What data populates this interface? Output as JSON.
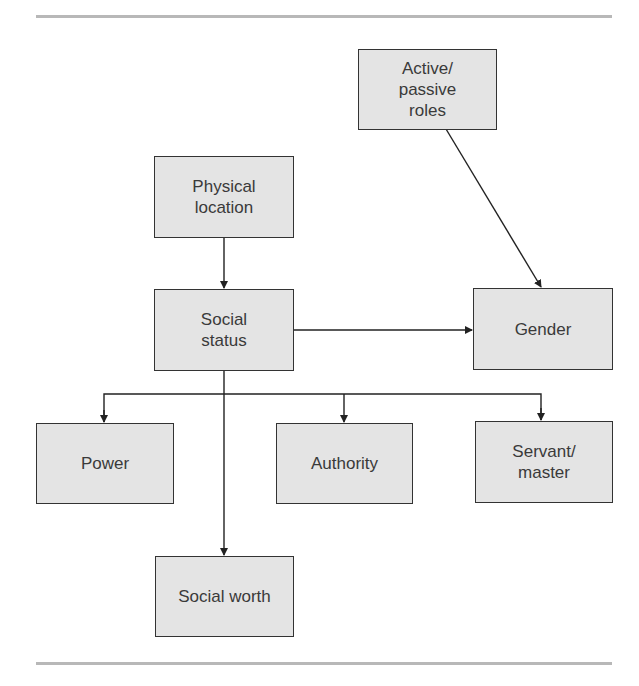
{
  "diagram": {
    "nodes": [
      {
        "id": "active_passive_roles",
        "label": "Active/\npassive\nroles"
      },
      {
        "id": "physical_location",
        "label": "Physical\nlocation"
      },
      {
        "id": "social_status",
        "label": "Social\nstatus"
      },
      {
        "id": "gender",
        "label": "Gender"
      },
      {
        "id": "power",
        "label": "Power"
      },
      {
        "id": "authority",
        "label": "Authority"
      },
      {
        "id": "servant_master",
        "label": "Servant/\nmaster"
      },
      {
        "id": "social_worth",
        "label": "Social worth"
      }
    ],
    "edges": [
      {
        "from": "physical_location",
        "to": "social_status"
      },
      {
        "from": "active_passive_roles",
        "to": "gender"
      },
      {
        "from": "social_status",
        "to": "gender"
      },
      {
        "from": "social_status",
        "to": "power"
      },
      {
        "from": "social_status",
        "to": "authority"
      },
      {
        "from": "social_status",
        "to": "servant_master"
      },
      {
        "from": "social_status",
        "to": "social_worth"
      }
    ],
    "colors": {
      "box_fill": "#e4e4e4",
      "box_border": "#333333",
      "rule": "#b8b8b8"
    }
  }
}
